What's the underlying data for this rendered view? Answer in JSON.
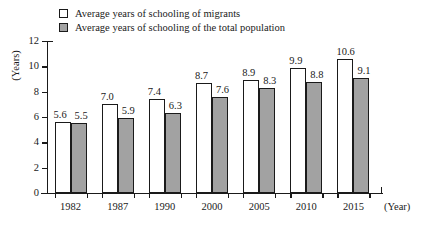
{
  "chart_data": {
    "type": "bar",
    "title": "",
    "xlabel": "(Year)",
    "ylabel": "(Years)",
    "categories": [
      "1982",
      "1987",
      "1990",
      "2000",
      "2005",
      "2010",
      "2015"
    ],
    "series": [
      {
        "name": "Average years of schooling of migrants",
        "values": [
          5.6,
          7.0,
          7.4,
          8.7,
          8.9,
          9.9,
          10.6
        ],
        "labels": [
          "5.6",
          "7.0",
          "7.4",
          "8.7",
          "8.9",
          "9.9",
          "10.6"
        ],
        "color": "#ffffff",
        "swatch": "white"
      },
      {
        "name": "Average years of schooling of the total population",
        "values": [
          5.5,
          5.9,
          6.3,
          7.6,
          8.3,
          8.8,
          9.1
        ],
        "labels": [
          "5.5",
          "5.9",
          "6.3",
          "7.6",
          "8.3",
          "8.8",
          "9.1"
        ],
        "color": "#a2a2a2",
        "swatch": "gray"
      }
    ],
    "ylim": [
      0,
      12
    ],
    "yticks": [
      0,
      2,
      4,
      6,
      8,
      10,
      12
    ],
    "ytick_labels": [
      "0",
      "2",
      "4",
      "6",
      "8",
      "10",
      "12"
    ],
    "grid": false,
    "legend_position": "top"
  },
  "legend": {
    "items": [
      {
        "label": "Average years of schooling of migrants",
        "swatch": "white"
      },
      {
        "label": "Average years of schooling of the total population",
        "swatch": "gray"
      }
    ]
  }
}
